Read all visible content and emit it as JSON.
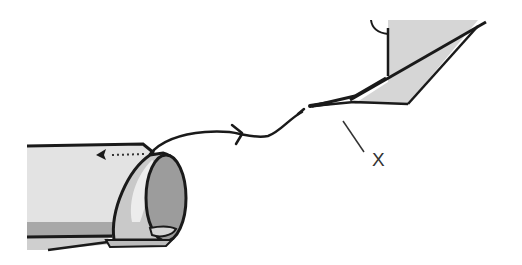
{
  "diagram": {
    "title": "",
    "labels": [
      {
        "id": "x",
        "text": "X",
        "x": 372,
        "y": 150
      }
    ],
    "parts": {
      "tube": {
        "name": "cylindrical tube with curled end",
        "fill_light": "#e2e2e2",
        "fill_mid": "#c8c8c8",
        "fill_dark": "#9a9a9a",
        "stroke": "#1a1a1a"
      },
      "thread": {
        "name": "thread / wire pulled through",
        "stroke": "#1a1a1a"
      },
      "arrow": {
        "name": "dotted direction arrow",
        "direction": "left"
      },
      "blade": {
        "name": "angled blade / point",
        "fill": "#d8d8d8",
        "stroke": "#1a1a1a"
      },
      "leader": {
        "name": "leader line to label X",
        "stroke": "#333333"
      }
    },
    "colors": {
      "background": "#ffffff",
      "outline": "#1a1a1a",
      "light_gray": "#e0e0e0",
      "mid_gray": "#bdbdbd",
      "dark_gray": "#8e8e8e"
    }
  }
}
